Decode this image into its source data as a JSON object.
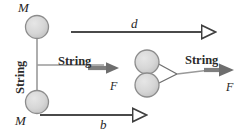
{
  "figure": {
    "colors": {
      "mass_fill": "#d4d4d4",
      "mass_stroke": "#8c8c8c",
      "string": "#9a9a9a",
      "force_arrow": "#7a7a7a",
      "dimension_line": "#4a4a4a",
      "text": "#262626",
      "background": "#ffffff"
    }
  },
  "left_configuration": {
    "mass_top_label": "M",
    "mass_bottom_label": "M",
    "string_vertical_label": "String",
    "string_horizontal_label": "String",
    "force_label": "F"
  },
  "right_configuration": {
    "string_label": "String",
    "force_label": "F"
  },
  "dimensions": {
    "top_label": "d",
    "bottom_label": "b"
  },
  "icons": {
    "mass_top": "circle-mass-icon",
    "mass_bottom": "circle-mass-icon",
    "mass_right_top": "circle-mass-icon",
    "mass_right_bottom": "circle-mass-icon",
    "force_arrow_left": "arrow-right-solid-icon",
    "force_arrow_right": "arrow-right-solid-icon",
    "dimension_arrow_top": "arrow-right-hollow-icon",
    "dimension_arrow_bottom": "arrow-right-hollow-icon"
  }
}
